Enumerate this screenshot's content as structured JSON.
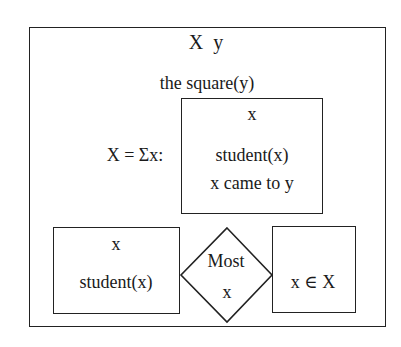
{
  "drs": {
    "header": "X  y",
    "condition_top": "the square(y)",
    "duplex_label": "X = Σx:",
    "inner_box": {
      "referent": "x",
      "conditions": [
        "student(x)",
        "x came to y"
      ]
    },
    "restrictor_box": {
      "referent": "x",
      "condition": "student(x)"
    },
    "quantifier": {
      "determiner": "Most",
      "variable": "x"
    },
    "scope_box": {
      "condition": "x ∈ X"
    }
  }
}
